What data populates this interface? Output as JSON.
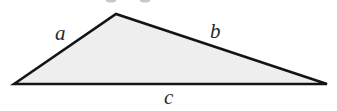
{
  "diagram": {
    "type": "triangle",
    "fill_color": "#eeeeee",
    "stroke_color": "#141414",
    "vertices": {
      "left": [
        14,
        84
      ],
      "top": [
        116,
        14
      ],
      "right": [
        327,
        84
      ]
    },
    "labels": {
      "a": "a",
      "b": "b",
      "c": "c"
    }
  }
}
